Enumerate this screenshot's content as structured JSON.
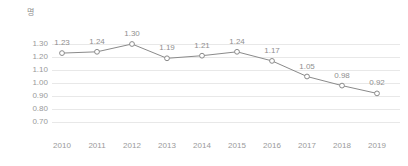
{
  "chart_data": {
    "type": "line",
    "title": "",
    "xlabel": "",
    "ylabel": "명",
    "unit_label": "명",
    "categories": [
      "2010",
      "2011",
      "2012",
      "2013",
      "2014",
      "2015",
      "2016",
      "2017",
      "2018",
      "2019"
    ],
    "values": [
      1.23,
      1.24,
      1.3,
      1.19,
      1.21,
      1.24,
      1.17,
      1.05,
      0.98,
      0.92
    ],
    "point_labels": [
      "1.23",
      "1.24",
      "1.30",
      "1.19",
      "1.21",
      "1.24",
      "1.17",
      "1.05",
      "0.98",
      "0.92"
    ],
    "ylim": [
      0.7,
      1.3
    ],
    "ytick_values": [
      1.3,
      1.2,
      1.1,
      1.0,
      0.9,
      0.8,
      0.7
    ],
    "ytick_labels": [
      "1.30",
      "1.20",
      "1.10",
      "1.00",
      "0.90",
      "0.80",
      "0.70"
    ],
    "grid": true,
    "grid_axis": "y",
    "legend": false,
    "legend_position": "none",
    "marker": "open-circle",
    "colors": {
      "line": "#8a8a8a",
      "marker_fill": "#ffffff",
      "marker_stroke": "#8a8a8a",
      "grid": "#e8e8e8",
      "tick_text": "#9a9a9a",
      "label_text": "#8f8f8f",
      "background": "#ffffff"
    }
  }
}
